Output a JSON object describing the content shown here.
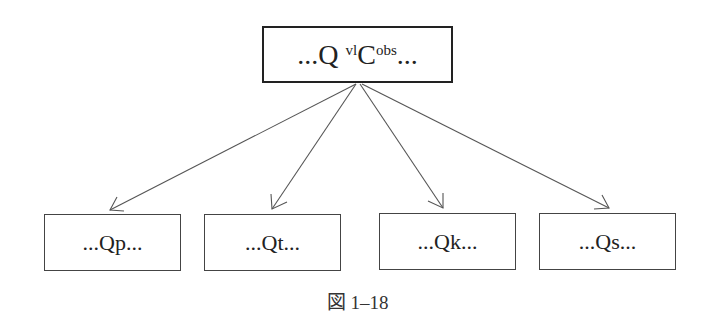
{
  "diagram": {
    "root": {
      "prefix": "...Q ",
      "sup1": "vl",
      "main": "C",
      "sup2": "obs",
      "suffix": "..."
    },
    "children": [
      {
        "label": "...Qp..."
      },
      {
        "label": "...Qt..."
      },
      {
        "label": "...Qk..."
      },
      {
        "label": "...Qs..."
      }
    ],
    "caption": "図 1–18",
    "colors": {
      "line": "#444444",
      "border": "#222222"
    }
  }
}
